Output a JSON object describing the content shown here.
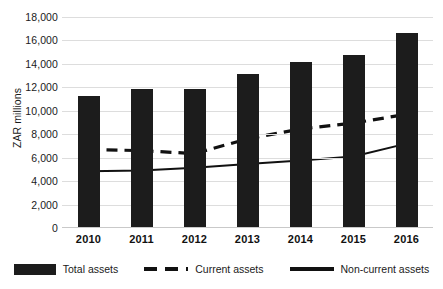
{
  "chart_data": {
    "type": "bar",
    "title": "",
    "xlabel": "",
    "ylabel": "ZAR millions",
    "categories": [
      "2010",
      "2011",
      "2012",
      "2013",
      "2014",
      "2015",
      "2016"
    ],
    "ylim": [
      0,
      18000
    ],
    "yticks": [
      0,
      2000,
      4000,
      6000,
      8000,
      10000,
      12000,
      14000,
      16000,
      18000
    ],
    "ytick_labels": [
      "0",
      "2,000",
      "4,000",
      "6,000",
      "8,000",
      "10,000",
      "12,000",
      "14,000",
      "16,000",
      "18,000"
    ],
    "grid": true,
    "legend_position": "bottom",
    "series": [
      {
        "name": "Total assets",
        "type": "bar",
        "color": "#1c1c1c",
        "values": [
          11300,
          11900,
          11900,
          13100,
          14200,
          14800,
          16650
        ]
      },
      {
        "name": "Current assets",
        "type": "line",
        "style": "dashed",
        "color": "#111111",
        "values": [
          6700,
          6600,
          6350,
          7600,
          8450,
          8950,
          9700
        ]
      },
      {
        "name": "Non-current assets",
        "type": "line",
        "style": "solid",
        "color": "#111111",
        "values": [
          4850,
          4900,
          5150,
          5450,
          5750,
          6100,
          7200
        ]
      }
    ]
  },
  "legend": {
    "items": [
      {
        "label": "Total assets",
        "marker": "filled-rect-swatch"
      },
      {
        "label": "Current assets",
        "marker": "dashed-line-swatch"
      },
      {
        "label": "Non-current assets",
        "marker": "solid-line-swatch"
      }
    ]
  }
}
